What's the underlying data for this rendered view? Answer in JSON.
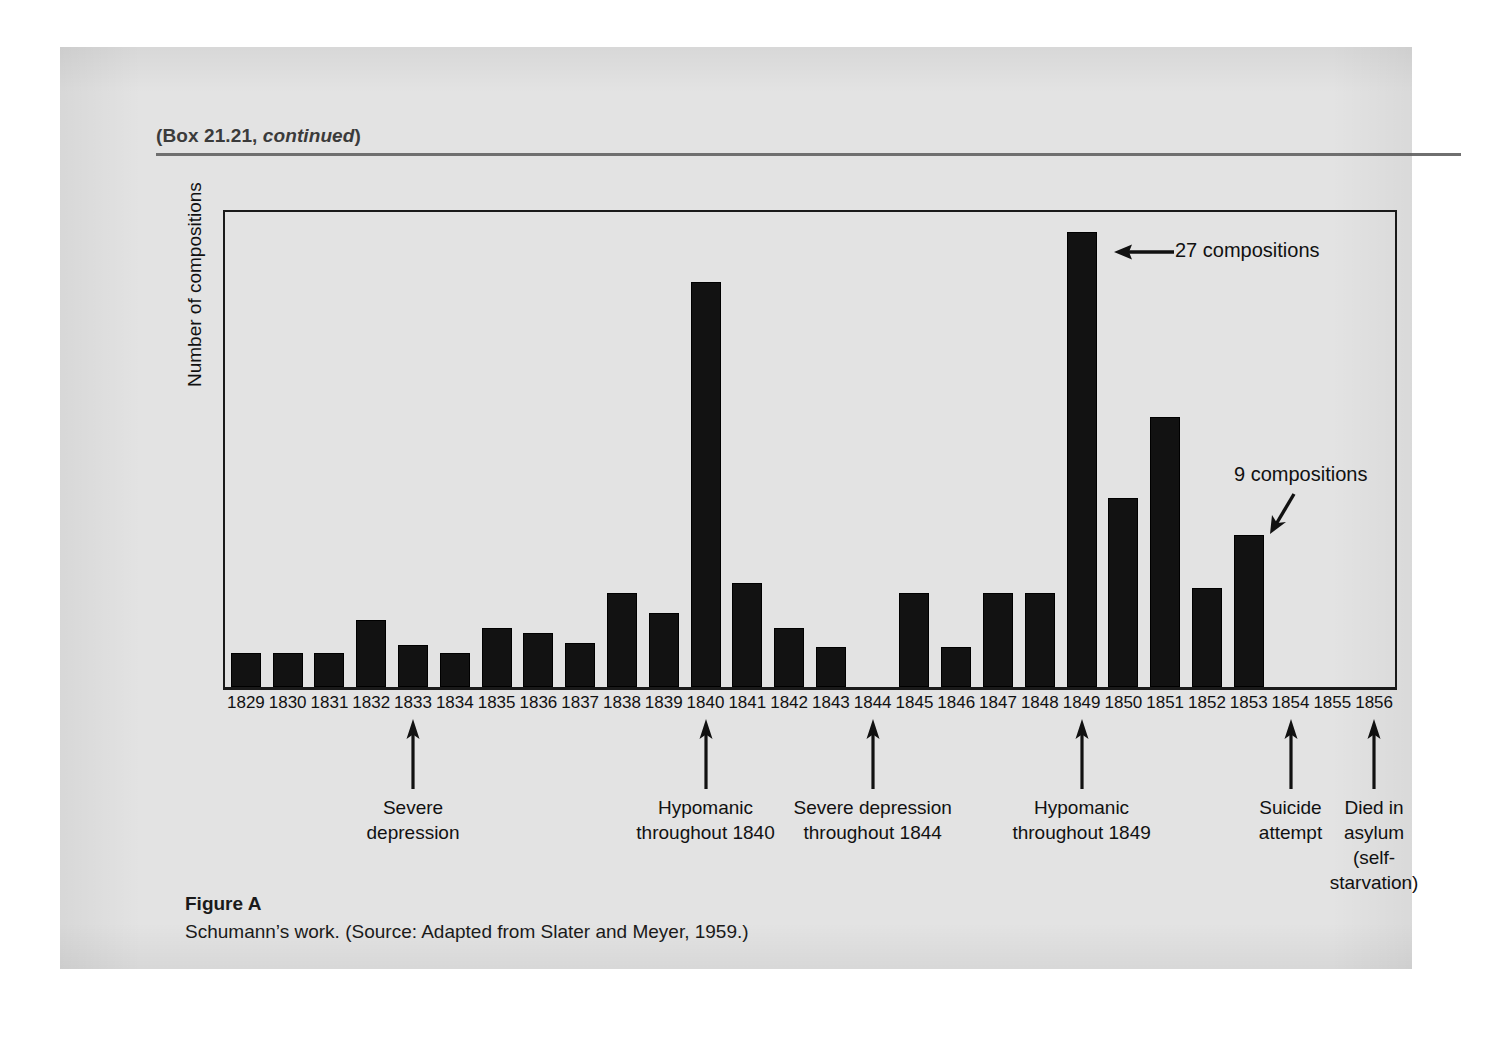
{
  "box_header": {
    "prefix": "(Box 21.21, ",
    "italic": "continued",
    "suffix": ")"
  },
  "caption": {
    "title": "Figure A",
    "text": "Schumann’s work. (Source: Adapted from Slater and Meyer, 1959.)"
  },
  "chart_data": {
    "type": "bar",
    "title": "",
    "xlabel": "",
    "ylabel": "Number of compositions",
    "ylim": [
      0,
      28
    ],
    "grid": false,
    "legend": "none",
    "categories": [
      "1829",
      "1830",
      "1831",
      "1832",
      "1833",
      "1834",
      "1835",
      "1836",
      "1837",
      "1838",
      "1839",
      "1840",
      "1841",
      "1842",
      "1843",
      "1844",
      "1845",
      "1846",
      "1847",
      "1848",
      "1849",
      "1850",
      "1851",
      "1852",
      "1853",
      "1854",
      "1855",
      "1856"
    ],
    "values": [
      2,
      2,
      2,
      4,
      2.5,
      2,
      3.5,
      3.2,
      2.6,
      5.6,
      4.4,
      24,
      6.2,
      3.5,
      2.4,
      0,
      5.6,
      2.4,
      5.6,
      5.6,
      27,
      11.2,
      16,
      5.9,
      9,
      0,
      0,
      0
    ],
    "annotations": [
      {
        "id": "ann-27",
        "label": "27 compositions",
        "target_year": "1849",
        "arrow": "left"
      },
      {
        "id": "ann-9",
        "label": "9 compositions",
        "target_year": "1853",
        "arrow": "down-left"
      }
    ]
  },
  "event_annotations": [
    {
      "id": "severe-depression-1833",
      "label": "Severe\ndepression",
      "year": "1833"
    },
    {
      "id": "hypomanic-1840",
      "label": "Hypomanic\nthroughout 1840",
      "year": "1840"
    },
    {
      "id": "severe-depression-1844",
      "label": "Severe depression\nthroughout 1844",
      "year": "1844"
    },
    {
      "id": "hypomanic-1849",
      "label": "Hypomanic\nthroughout 1849",
      "year": "1849"
    },
    {
      "id": "suicide-attempt-1854",
      "label": "Suicide\nattempt",
      "year": "1854"
    },
    {
      "id": "died-in-asylum-1856",
      "label": "Died in\nasylum\n(self-\nstarvation)",
      "year": "1856"
    }
  ],
  "colors": {
    "bar": "#121212",
    "axis": "#1a1a1a",
    "paper": "#e3e3e3",
    "rule": "#6f6f6f",
    "text": "#111111"
  }
}
